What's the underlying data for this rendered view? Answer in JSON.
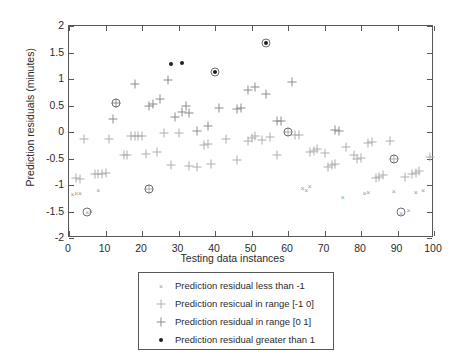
{
  "chart_data": {
    "type": "scatter",
    "title": "",
    "xlabel": "Testing data instances",
    "ylabel": "Prediction residuals (minutes)",
    "xlim": [
      0,
      100
    ],
    "ylim": [
      -2,
      2
    ],
    "xticks": [
      "0",
      "10",
      "20",
      "30",
      "40",
      "50",
      "60",
      "70",
      "80",
      "90",
      "100"
    ],
    "yticks": [
      "-2",
      "-1.5",
      "-1",
      "-0.5",
      "0",
      "0.5",
      "1",
      "1.5",
      "2"
    ],
    "grid": false,
    "legend_position": "below-axes",
    "series": [
      {
        "name": "less_than_minus1",
        "label": "Prediction residual less than -1",
        "marker": "small-x",
        "color": "#9a9a9a",
        "points": [
          [
            1,
            -1.17
          ],
          [
            2,
            -1.15
          ],
          [
            3,
            -1.15
          ],
          [
            5,
            -1.5
          ],
          [
            6,
            -1.49
          ],
          [
            8,
            -1.1
          ],
          [
            64,
            -1.05
          ],
          [
            65,
            -1.1
          ],
          [
            66,
            -1.02
          ],
          [
            75,
            -1.23
          ],
          [
            81,
            -1.16
          ],
          [
            82,
            -1.14
          ],
          [
            89,
            -1.12
          ],
          [
            91,
            -1.52
          ],
          [
            93,
            -1.48
          ],
          [
            95,
            -1.13
          ],
          [
            97,
            -1.1
          ]
        ]
      },
      {
        "name": "range_minus1_to_0",
        "label": "Prediction resicual in range [-1 0]",
        "marker": "plus-light",
        "color": "#adadad",
        "points": [
          [
            2,
            -0.86
          ],
          [
            3,
            -0.88
          ],
          [
            4,
            -0.13
          ],
          [
            7,
            -0.79
          ],
          [
            8,
            -0.79
          ],
          [
            9,
            -0.79
          ],
          [
            10,
            -0.78
          ],
          [
            11,
            -0.13
          ],
          [
            15,
            -0.44
          ],
          [
            16,
            -0.43
          ],
          [
            17,
            -0.07
          ],
          [
            18,
            -0.07
          ],
          [
            19,
            -0.07
          ],
          [
            20,
            -0.07
          ],
          [
            21,
            -0.42
          ],
          [
            22,
            -1.08
          ],
          [
            24,
            -0.37
          ],
          [
            26,
            -0.01
          ],
          [
            28,
            -0.62
          ],
          [
            30,
            -0.02
          ],
          [
            33,
            -0.65
          ],
          [
            35,
            -0.66
          ],
          [
            37,
            -0.25
          ],
          [
            38,
            -0.22
          ],
          [
            39,
            -0.6
          ],
          [
            43,
            -0.14
          ],
          [
            46,
            -0.52
          ],
          [
            49,
            -0.17
          ],
          [
            50,
            -0.12
          ],
          [
            51,
            -0.07
          ],
          [
            53,
            -0.15
          ],
          [
            55,
            -0.09
          ],
          [
            57,
            -0.44
          ],
          [
            60,
            0.0
          ],
          [
            62,
            -0.05
          ],
          [
            63,
            -0.06
          ],
          [
            66,
            -0.37
          ],
          [
            67,
            -0.35
          ],
          [
            68,
            -0.33
          ],
          [
            70,
            -0.39
          ],
          [
            71,
            -0.66
          ],
          [
            72,
            -0.63
          ],
          [
            73,
            -0.6
          ],
          [
            76,
            -0.29
          ],
          [
            78,
            -0.44
          ],
          [
            79,
            -0.5
          ],
          [
            80,
            -0.49
          ],
          [
            82,
            -0.2
          ],
          [
            83,
            -0.19
          ],
          [
            84,
            -0.87
          ],
          [
            85,
            -0.84
          ],
          [
            86,
            -0.82
          ],
          [
            88,
            -0.17
          ],
          [
            89,
            -0.51
          ],
          [
            92,
            -0.84
          ],
          [
            94,
            -0.8
          ],
          [
            95,
            -0.78
          ],
          [
            96,
            -0.74
          ],
          [
            99,
            -0.47
          ]
        ]
      },
      {
        "name": "range_0_to_1",
        "label": "Prediction residual in range [0 1]",
        "marker": "plus",
        "color": "#8c8c8c",
        "points": [
          [
            12,
            0.24
          ],
          [
            13,
            0.55
          ],
          [
            18,
            0.9
          ],
          [
            22,
            0.5
          ],
          [
            23,
            0.52
          ],
          [
            25,
            0.62
          ],
          [
            27,
            0.98
          ],
          [
            29,
            0.28
          ],
          [
            31,
            0.37
          ],
          [
            32,
            0.49
          ],
          [
            33,
            0.36
          ],
          [
            35,
            0.02
          ],
          [
            38,
            0.11
          ],
          [
            41,
            0.45
          ],
          [
            46,
            0.44
          ],
          [
            47,
            0.46
          ],
          [
            49,
            0.8
          ],
          [
            51,
            0.85
          ],
          [
            54,
            0.72
          ],
          [
            57,
            0.21
          ],
          [
            58,
            0.2
          ],
          [
            61,
            0.94
          ],
          [
            73,
            0.03
          ],
          [
            74,
            0.02
          ]
        ]
      },
      {
        "name": "greater_than_1",
        "label": "Prediction residual greater than 1",
        "marker": "dot",
        "color": "#1f1f1f",
        "points": [
          [
            28,
            1.29
          ],
          [
            31,
            1.31
          ],
          [
            40,
            1.14
          ],
          [
            54,
            1.67
          ]
        ]
      }
    ],
    "highlighted_points": [
      [
        5,
        -1.5
      ],
      [
        13,
        0.55
      ],
      [
        22,
        -1.08
      ],
      [
        40,
        1.14
      ],
      [
        54,
        1.67
      ],
      [
        60,
        0.0
      ],
      [
        89,
        -0.51
      ],
      [
        91,
        -1.5
      ]
    ]
  },
  "legend": {
    "items": [
      {
        "label": "Prediction residual less than -1",
        "marker": "small-x"
      },
      {
        "label": "Prediction resicual in range [-1 0]",
        "marker": "plus-light"
      },
      {
        "label": "Prediction residual in range [0 1]",
        "marker": "plus"
      },
      {
        "label": "Prediction residual greater than 1",
        "marker": "dot"
      }
    ]
  }
}
